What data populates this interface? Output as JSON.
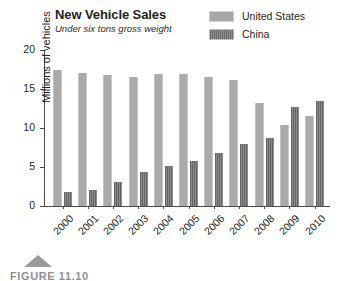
{
  "chart_data": {
    "type": "bar",
    "title": "New Vehicle Sales",
    "subtitle": "Under six tons gross weight",
    "xlabel": "",
    "ylabel": "Millions of vehicles",
    "ylim": [
      0,
      20
    ],
    "yticks": [
      0,
      5,
      10,
      15,
      20
    ],
    "grid": false,
    "legend_position": "top-right",
    "categories": [
      "2000",
      "2001",
      "2002",
      "2003",
      "2004",
      "2005",
      "2006",
      "2007",
      "2008",
      "2009",
      "2010"
    ],
    "series": [
      {
        "name": "United States",
        "color": "#aaaaaa",
        "values": [
          17.4,
          17.1,
          16.8,
          16.6,
          16.9,
          16.9,
          16.5,
          16.1,
          13.2,
          10.4,
          11.6
        ]
      },
      {
        "name": "China",
        "color": "#6f6f6f",
        "values": [
          1.8,
          2.1,
          3.1,
          4.4,
          5.1,
          5.8,
          6.8,
          8.0,
          8.7,
          12.7,
          13.5
        ]
      }
    ]
  },
  "legend": {
    "items": [
      {
        "label": "United States",
        "swatch": "us"
      },
      {
        "label": "China",
        "swatch": "cn"
      }
    ]
  },
  "caption": {
    "text": "FIGURE 11.10"
  }
}
